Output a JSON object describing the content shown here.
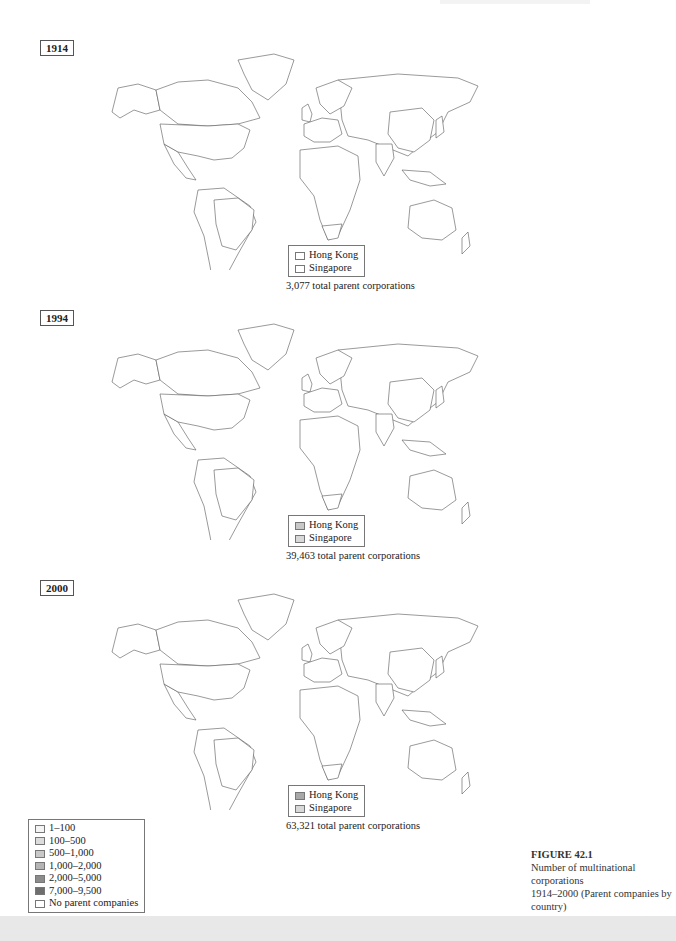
{
  "maps": [
    {
      "year": "1914",
      "inset": [
        {
          "label": "Hong Kong",
          "color": "#ffffff"
        },
        {
          "label": "Singapore",
          "color": "#ffffff"
        }
      ],
      "total": "3,077 total parent corporations",
      "regions": {
        "alaska": "#ffffff",
        "canada": "#ffffff",
        "usa": "#ececec",
        "brazil": "#ffffff",
        "uk": "#6e6e6e",
        "westeurope": "#ececec",
        "scandinavia": "#ffffff",
        "china": "#ffffff",
        "india": "#ffffff",
        "japan": "#ffffff",
        "australia": "#ffffff",
        "southafrica": "#ffffff"
      }
    },
    {
      "year": "1994",
      "inset": [
        {
          "label": "Hong Kong",
          "color": "#c8c8c8"
        },
        {
          "label": "Singapore",
          "color": "#d8d8d8"
        }
      ],
      "total": "39,463 total parent corporations",
      "regions": {
        "alaska": "#8c8c8c",
        "canada": "#dcdcdc",
        "usa": "#8c8c8c",
        "brazil": "#8c8c8c",
        "uk": "#6e6e6e",
        "westeurope": "#d0d0d0",
        "scandinavia": "#8c8c8c",
        "china": "#8c8c8c",
        "india": "#c8c8c8",
        "japan": "#6e6e6e",
        "australia": "#8c8c8c",
        "southafrica": "#ffffff"
      }
    },
    {
      "year": "2000",
      "inset": [
        {
          "label": "Hong Kong",
          "color": "#a8a8a8"
        },
        {
          "label": "Singapore",
          "color": "#d8d8d8"
        }
      ],
      "total": "63,321 total parent corporations",
      "regions": {
        "alaska": "#8c8c8c",
        "canada": "#dcdcdc",
        "usa": "#8c8c8c",
        "brazil": "#8c8c8c",
        "uk": "#6e6e6e",
        "westeurope": "#a8a8a8",
        "scandinavia": "#8c8c8c",
        "china": "#dcdcdc",
        "india": "#dcdcdc",
        "japan": "#6e6e6e",
        "australia": "#8c8c8c",
        "southafrica": "#c8c8c8"
      }
    }
  ],
  "legend": [
    {
      "label": "1–100",
      "color": "#f4f4f4"
    },
    {
      "label": "100–500",
      "color": "#dcdcdc"
    },
    {
      "label": "500–1,000",
      "color": "#c8c8c8"
    },
    {
      "label": "1,000–2,000",
      "color": "#b4b4b4"
    },
    {
      "label": "2,000–5,000",
      "color": "#8c8c8c"
    },
    {
      "label": "7,000–9,500",
      "color": "#6e6e6e"
    },
    {
      "label": "No parent companies",
      "color": "#ffffff"
    }
  ],
  "caption": {
    "figure": "FIGURE 42.1",
    "line1": "Number of multinational corporations",
    "line2": "1914–2000 (Parent companies by country)",
    "line3": "Source: Gabel and Bruner (2003: 31)"
  }
}
